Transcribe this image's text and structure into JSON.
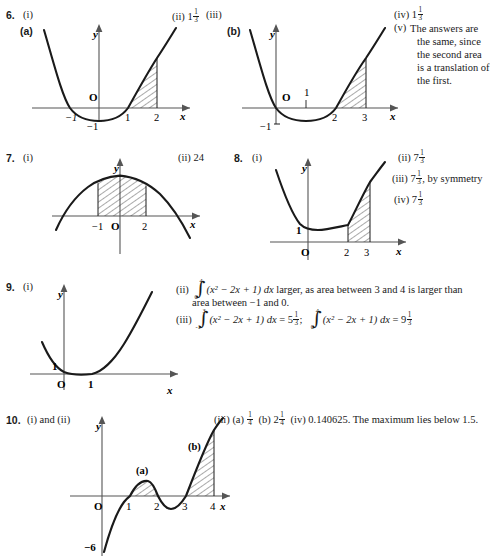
{
  "page": {
    "width": 494,
    "height": 558
  },
  "items": [
    {
      "number": "6.",
      "part_i": "(i)",
      "answers": [
        {
          "key": "ii",
          "label": "(ii)",
          "value": "1",
          "frac": "1/3"
        },
        {
          "key": "iii",
          "label": "(iii)",
          "value": "",
          "frac": ""
        },
        {
          "key": "iv",
          "label": "(iv)",
          "value": "1",
          "frac": "1/3"
        }
      ],
      "note_label": "(v)",
      "note_lines": [
        "The answers are",
        "the same, since",
        "the second area",
        "is a translation of",
        "the first."
      ],
      "graphs": [
        {
          "tag": "(a)",
          "axis_y": "y",
          "axis_x": "x",
          "origin": "O",
          "x_ticks": [
            "-1",
            "1",
            "2"
          ],
          "y_ticks": [
            "-1"
          ],
          "curve": "parabola-up-roots--1-1",
          "shaded_from": "1",
          "shaded_to": "2"
        },
        {
          "tag": "(b)",
          "axis_y": "y",
          "axis_x": "x",
          "origin": "O",
          "x_ticks": [
            "2",
            "3"
          ],
          "y_ticks": [
            "-1"
          ],
          "inner_tick": "1",
          "curve": "parabola-up-roots-0-2",
          "shaded_from": "2",
          "shaded_to": "3"
        }
      ]
    },
    {
      "number": "7.",
      "part_i": "(i)",
      "answers": [
        {
          "key": "ii",
          "label": "(ii)",
          "value": "24",
          "frac": ""
        }
      ],
      "graphs": [
        {
          "tag": "",
          "axis_y": "y",
          "axis_x": "x",
          "origin": "O",
          "x_ticks": [
            "-1",
            "2"
          ],
          "curve": "parabola-down",
          "shaded_from": "-1",
          "shaded_to": "2"
        }
      ]
    },
    {
      "number": "8.",
      "part_i": "(i)",
      "answers": [
        {
          "key": "ii",
          "label": "(ii)",
          "value": "7",
          "frac": "1/3"
        },
        {
          "key": "iii",
          "label": "(iii)",
          "value": "7",
          "frac": "1/3",
          "suffix": ", by symmetry"
        },
        {
          "key": "iv",
          "label": "(iv)",
          "value": "7",
          "frac": "1/3"
        }
      ],
      "graphs": [
        {
          "tag": "",
          "axis_y": "y",
          "axis_x": "x",
          "origin": "O",
          "x_ticks": [
            "2",
            "3"
          ],
          "y_ticks": [
            "1"
          ],
          "curve": "parabola-up-vertex-1",
          "shaded_from": "2",
          "shaded_to": "3"
        }
      ]
    },
    {
      "number": "9.",
      "part_i": "(i)",
      "text_ii": {
        "label": "(ii)",
        "integral": {
          "lo": "0",
          "hi": "4",
          "body": "(x² − 2x + 1) dx"
        },
        "after": " larger, as area between 3 and 4 is larger than",
        "line2": "area between −1 and 0."
      },
      "text_iii": {
        "label": "(iii)",
        "integral1": {
          "lo": "-1",
          "hi": "3",
          "body": "(x² − 2x + 1) dx"
        },
        "eq1": " = 5",
        "frac1": "1/3",
        "sep": ";",
        "integral2": {
          "lo": "0",
          "hi": "4",
          "body": "(x² − 2x + 1) dx"
        },
        "eq2": " = 9",
        "frac2": "1/3"
      },
      "graphs": [
        {
          "tag": "",
          "axis_y": "y",
          "axis_x": "x",
          "origin": "O",
          "x_ticks": [
            "1"
          ],
          "y_ticks": [
            "1"
          ],
          "curve": "parabola-up-tangent-1"
        }
      ]
    },
    {
      "number": "10.",
      "part_i": "(i) and (ii)",
      "answers_line": {
        "label": "(iii)",
        "a_label": "(a)",
        "a_value": "",
        "a_frac": "1/4",
        "b_label": "(b)",
        "b_value": "2",
        "b_frac": "1/4",
        "iv_label": "(iv)",
        "iv_text": "0.140625. The maximum lies below 1.5."
      },
      "graphs": [
        {
          "tag": "",
          "axis_y": "y",
          "axis_x": "x",
          "origin": "O",
          "x_ticks": [
            "1",
            "2",
            "3",
            "4"
          ],
          "y_ticks": [
            "-6"
          ],
          "region_labels": [
            "(a)",
            "(b)"
          ],
          "curve": "cubic-roots-1-2-3",
          "shaded_a_from": "1",
          "shaded_a_to": "2",
          "shaded_b_from": "3",
          "shaded_b_to": "4"
        }
      ]
    }
  ],
  "colors": {
    "ink": "#1a1a1a",
    "axis": "#4a4a4a",
    "hatch": "#2b2b2b"
  }
}
